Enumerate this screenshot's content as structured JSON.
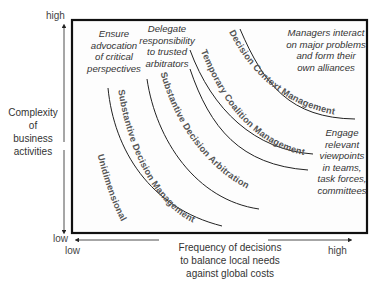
{
  "y_axis": {
    "title_lines": [
      "Complexity",
      "of",
      "business",
      "activities"
    ],
    "high_label": "high",
    "low_label": "low"
  },
  "x_axis": {
    "title_lines": [
      "Frequency of decisions",
      "to balance local needs",
      "against global costs"
    ],
    "low_label": "low",
    "high_label": "high"
  },
  "annotations": {
    "top_left": [
      "Ensure",
      "advocation",
      "of critical",
      "perspectives"
    ],
    "top_middle": [
      "Delegate",
      "responsibility",
      "to trusted",
      "arbitrators"
    ],
    "top_right": [
      "Managers interact",
      "on major problems",
      "and form their",
      "own alliances"
    ],
    "right": [
      "Engage",
      "relevant",
      "viewpoints",
      "in teams,",
      "task forces,",
      "committees"
    ]
  },
  "curves": [
    {
      "label": "Unidimensional Approach"
    },
    {
      "label": "Substantive Decision Management"
    },
    {
      "label": "Substantive Decision Arbitration"
    },
    {
      "label": "Temporary Coalition Management"
    },
    {
      "label": "Decision Context Management"
    }
  ]
}
